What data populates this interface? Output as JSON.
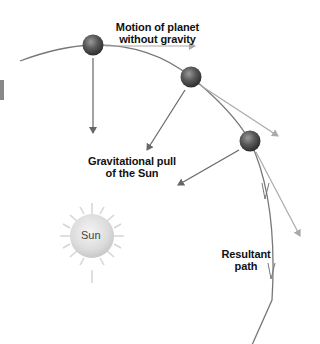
{
  "diagram": {
    "labels": {
      "motion_without_gravity_line1": "Motion of planet",
      "motion_without_gravity_line2": "without gravity",
      "gravitational_pull_line1": "Gravitational pull",
      "gravitational_pull_line2": "of the Sun",
      "resultant_path_line1": "Resultant",
      "resultant_path_line2": "path",
      "sun": "Sun"
    },
    "colors": {
      "orbit": "#777777",
      "gravity_arrow": "#666666",
      "tangent_arrow": "#aaaaaa",
      "sun_fill": "#e0e0e0",
      "planet": "#555555"
    },
    "planets": [
      {
        "x": 93,
        "y": 45
      },
      {
        "x": 191,
        "y": 77
      },
      {
        "x": 250,
        "y": 141
      }
    ]
  }
}
